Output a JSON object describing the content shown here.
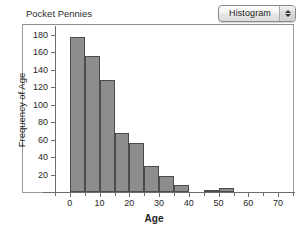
{
  "window": {
    "background": "#ffffff"
  },
  "toolbar": {
    "plot_type_selector": {
      "name": "plot-type-popup",
      "value": "Histogram",
      "stepper_up_icon": "arrow-up-icon",
      "stepper_down_icon": "arrow-down-icon"
    }
  },
  "chart_data": {
    "type": "bar",
    "title": "Pocket Pennies",
    "xlabel": "Age",
    "ylabel": "Frequency of Age",
    "xlim": [
      -5,
      75
    ],
    "ylim": [
      0,
      188
    ],
    "grid": false,
    "legend": null,
    "bar_color": "#8d8d8d",
    "bar_edge_color": "#4c4c4c",
    "bin_width": 5,
    "x_ticks": [
      0,
      10,
      20,
      30,
      40,
      50,
      60,
      70
    ],
    "x_tick_labels": [
      "0",
      "10",
      "20",
      "30",
      "40",
      "50",
      "60",
      "70"
    ],
    "x_minor_ticks": [
      -5,
      0,
      5,
      10,
      15,
      20,
      25,
      30,
      35,
      40,
      45,
      50,
      55,
      60,
      65,
      70,
      75
    ],
    "y_ticks": [
      20,
      40,
      60,
      80,
      100,
      120,
      140,
      160,
      180
    ],
    "y_tick_labels": [
      "20",
      "40",
      "60",
      "80",
      "100",
      "120",
      "140",
      "160",
      "180"
    ],
    "bins": [
      {
        "x0": 0,
        "x1": 5,
        "value": 178
      },
      {
        "x0": 5,
        "x1": 10,
        "value": 156
      },
      {
        "x0": 10,
        "x1": 15,
        "value": 128
      },
      {
        "x0": 15,
        "x1": 20,
        "value": 68
      },
      {
        "x0": 20,
        "x1": 25,
        "value": 56
      },
      {
        "x0": 25,
        "x1": 30,
        "value": 30
      },
      {
        "x0": 30,
        "x1": 35,
        "value": 18
      },
      {
        "x0": 35,
        "x1": 40,
        "value": 8
      },
      {
        "x0": 40,
        "x1": 45,
        "value": 0
      },
      {
        "x0": 45,
        "x1": 50,
        "value": 2
      },
      {
        "x0": 50,
        "x1": 55,
        "value": 5
      }
    ],
    "categories": [
      "0-5",
      "5-10",
      "10-15",
      "15-20",
      "20-25",
      "25-30",
      "30-35",
      "35-40",
      "40-45",
      "45-50",
      "50-55"
    ],
    "values": [
      178,
      156,
      128,
      68,
      56,
      30,
      18,
      8,
      0,
      2,
      5
    ]
  }
}
